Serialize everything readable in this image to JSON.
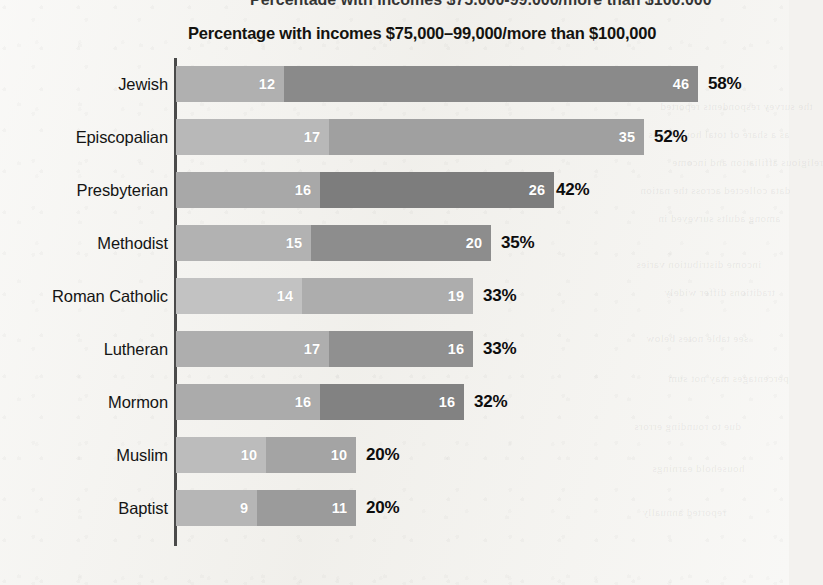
{
  "page": {
    "background_color": "#f2f1ed",
    "top_cropped_text": "Percentage with incomes $75,000-99,000/more than $100,000",
    "bleed_through_snippets": [
      "the survey respondents reported",
      "as a share of total households",
      "religious affiliation and income",
      "data collected across the nation",
      "among adults surveyed in",
      "income distribution varies",
      "traditions differ widely",
      "see table notes below",
      "percentages may not sum",
      "due to rounding errors",
      "household earnings",
      "reported annually"
    ]
  },
  "chart_data": {
    "type": "bar",
    "orientation": "horizontal",
    "stacked": true,
    "title": "Percentage with incomes $75,000–99,000/more than $100,000",
    "xlabel": "",
    "ylabel": "",
    "grid": false,
    "legend_position": "none",
    "xlim": [
      0,
      58
    ],
    "value_suffix": "%",
    "categories": [
      "Jewish",
      "Episcopalian",
      "Presbyterian",
      "Methodist",
      "Roman Catholic",
      "Lutheran",
      "Mormon",
      "Muslim",
      "Baptist"
    ],
    "series": [
      {
        "name": "$75,000–99,000",
        "color": "#b3b3b3",
        "values": [
          12,
          17,
          16,
          15,
          14,
          17,
          16,
          10,
          9
        ]
      },
      {
        "name": "more than $100,000",
        "color": "#8c8c8c",
        "values": [
          46,
          35,
          26,
          20,
          19,
          16,
          16,
          10,
          11
        ]
      }
    ],
    "totals": [
      58,
      52,
      42,
      35,
      33,
      33,
      32,
      20,
      20
    ],
    "total_labels": [
      "58%",
      "52%",
      "42%",
      "35%",
      "33%",
      "33%",
      "32%",
      "20%",
      "20%"
    ],
    "row_segment_colors": [
      {
        "light": "#b0b0b0",
        "dark": "#8a8a8a"
      },
      {
        "light": "#b8b8b8",
        "dark": "#a0a0a0"
      },
      {
        "light": "#a8a8a8",
        "dark": "#7d7d7d"
      },
      {
        "light": "#b2b2b2",
        "dark": "#8d8d8d"
      },
      {
        "light": "#c2c2c2",
        "dark": "#adadad"
      },
      {
        "light": "#aeaeae",
        "dark": "#909090"
      },
      {
        "light": "#ababab",
        "dark": "#828282"
      },
      {
        "light": "#bcbcbc",
        "dark": "#a4a4a4"
      },
      {
        "light": "#b6b6b6",
        "dark": "#9b9b9b"
      }
    ]
  },
  "geometry": {
    "axis_x": 176,
    "px_per_unit": 9.0,
    "first_row_top": 66,
    "row_pitch": 53,
    "bar_height": 36,
    "total_gap": 10
  }
}
